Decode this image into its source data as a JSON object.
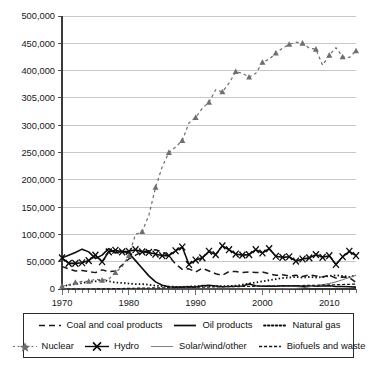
{
  "chart_data": {
    "type": "line",
    "title": "",
    "subtitle": "",
    "xlabel": "",
    "ylabel": "",
    "xlim": [
      1970,
      2014
    ],
    "ylim": [
      0,
      500000
    ],
    "grid": true,
    "legend_position": "bottom",
    "y_ticks": [
      0,
      50000,
      100000,
      150000,
      200000,
      250000,
      300000,
      305000,
      400000,
      450000,
      500000
    ],
    "y_tick_labels": [
      "0",
      "50,000",
      "100,000",
      "150,000",
      "200,000",
      "250,000",
      "300,000",
      "305,000",
      "400,000",
      "450,000",
      "500,000"
    ],
    "x_ticks": [
      1970,
      1980,
      1990,
      2000,
      2010
    ],
    "x_tick_labels": [
      "1970",
      "1980",
      "1990",
      "2000",
      "2010"
    ],
    "x_minor_tick_interval": 1,
    "x": [
      1970,
      1971,
      1972,
      1973,
      1974,
      1975,
      1976,
      1977,
      1978,
      1979,
      1980,
      1981,
      1982,
      1983,
      1984,
      1985,
      1986,
      1987,
      1988,
      1989,
      1990,
      1991,
      1992,
      1993,
      1994,
      1995,
      1996,
      1997,
      1998,
      1999,
      2000,
      2001,
      2002,
      2003,
      2004,
      2005,
      2006,
      2007,
      2008,
      2009,
      2010,
      2011,
      2012,
      2013,
      2014
    ],
    "series": [
      {
        "name": "Coal and coal products",
        "style": "dashed",
        "marker": "none",
        "color": "#1a1a1a",
        "values": [
          41000,
          37000,
          33000,
          34000,
          32000,
          30000,
          35000,
          32000,
          33000,
          44000,
          55000,
          62000,
          68000,
          70000,
          72000,
          68000,
          60000,
          46000,
          36000,
          37000,
          31000,
          38000,
          33000,
          28000,
          25000,
          32000,
          32000,
          30000,
          31000,
          30000,
          31000,
          28000,
          25000,
          26000,
          24000,
          25000,
          23000,
          26000,
          24000,
          22000,
          25000,
          20000,
          22000,
          21000,
          12000
        ]
      },
      {
        "name": "Oil products",
        "style": "solid",
        "marker": "none",
        "color": "#0d0d0d",
        "values": [
          57000,
          62000,
          67000,
          73000,
          68000,
          56000,
          62000,
          74000,
          66000,
          69000,
          66000,
          52000,
          38000,
          24000,
          13000,
          7000,
          4000,
          3500,
          3500,
          4000,
          3500,
          6000,
          7000,
          5500,
          4000,
          4500,
          5000,
          5500,
          9000,
          6000,
          5000,
          5500,
          5000,
          6000,
          5500,
          6000,
          5000,
          5500,
          5000,
          5500,
          6000,
          4500,
          4500,
          4000,
          3500
        ]
      },
      {
        "name": "Natural gas",
        "style": "dotted",
        "marker": "none",
        "color": "#101010",
        "values": [
          5000,
          7000,
          9000,
          11000,
          13000,
          14000,
          17000,
          14000,
          12000,
          11000,
          10000,
          9000,
          9000,
          8000,
          6000,
          5000,
          4500,
          4000,
          4000,
          4500,
          5000,
          6000,
          5500,
          5000,
          5000,
          5500,
          6000,
          8000,
          10000,
          12000,
          14000,
          16000,
          18000,
          20000,
          21000,
          22000,
          21000,
          22000,
          21000,
          22000,
          24000,
          25000,
          24000,
          22000,
          25000
        ]
      },
      {
        "name": "Nuclear",
        "style": "dash-dot",
        "marker": "triangle",
        "color": "#6e6e6e",
        "values": [
          5000,
          8000,
          12000,
          14000,
          14000,
          18000,
          16000,
          18000,
          30000,
          41000,
          61000,
          100000,
          105000,
          135000,
          186000,
          224000,
          250000,
          260000,
          272000,
          304000,
          314000,
          331000,
          342000,
          365000,
          361000,
          377000,
          398000,
          395000,
          388000,
          395000,
          415000,
          421000,
          432000,
          441000,
          448000,
          452000,
          450000,
          441000,
          439000,
          410000,
          428000,
          442000,
          425000,
          424000,
          436000
        ]
      },
      {
        "name": "Hydro",
        "style": "solid",
        "marker": "x",
        "color": "#0d0d0d",
        "values": [
          57000,
          47000,
          47000,
          48000,
          52000,
          62000,
          50000,
          68000,
          71000,
          68000,
          69000,
          72000,
          68000,
          67000,
          64000,
          61000,
          61000,
          70000,
          77000,
          45000,
          53000,
          57000,
          69000,
          63000,
          79000,
          72000,
          64000,
          62000,
          63000,
          72000,
          66000,
          74000,
          60000,
          58000,
          59000,
          51000,
          55000,
          57000,
          63000,
          58000,
          61000,
          45000,
          59000,
          69000,
          61000
        ]
      },
      {
        "name": "Solar/wind/other",
        "style": "solid-thin",
        "marker": "none",
        "color": "#707070",
        "values": [
          0,
          0,
          0,
          0,
          0,
          0,
          0,
          0,
          0,
          0,
          0,
          0,
          0,
          0,
          0,
          0,
          0,
          0,
          0,
          0,
          0,
          0,
          0,
          0,
          0,
          0,
          0,
          0,
          0,
          0,
          100,
          200,
          300,
          400,
          600,
          1000,
          2200,
          4000,
          6000,
          8000,
          10000,
          13000,
          17000,
          21000,
          25000
        ]
      },
      {
        "name": "Biofuels and waste",
        "style": "dash-dot-short",
        "marker": "none",
        "color": "#1a1a1a",
        "values": [
          0,
          0,
          0,
          0,
          0,
          0,
          200,
          400,
          700,
          900,
          1200,
          1400,
          1600,
          1800,
          2000,
          2200,
          2400,
          2600,
          2800,
          3000,
          3200,
          3400,
          3600,
          3800,
          4000,
          4200,
          4400,
          4600,
          4800,
          5000,
          5200,
          5400,
          5600,
          5800,
          6000,
          6200,
          6400,
          6600,
          6800,
          7000,
          7400,
          7800,
          8200,
          8600,
          9000
        ]
      }
    ]
  },
  "legend": {
    "rows": [
      [
        {
          "label": "Coal and coal products",
          "style": "dashed",
          "marker": "none",
          "icon": "dashed-line-icon"
        },
        {
          "label": "Oil products",
          "style": "solid",
          "marker": "none",
          "icon": "solid-line-icon"
        },
        {
          "label": "Natural gas",
          "style": "dotted",
          "marker": "none",
          "icon": "dotted-line-icon"
        }
      ],
      [
        {
          "label": "Nuclear",
          "style": "dash-dot",
          "marker": "star",
          "icon": "star-marker-line-icon"
        },
        {
          "label": "Hydro",
          "style": "solid",
          "marker": "x",
          "icon": "x-marker-line-icon"
        },
        {
          "label": "Solar/wind/other",
          "style": "solid-thin",
          "marker": "none",
          "icon": "thin-line-icon"
        },
        {
          "label": "Biofuels and waste",
          "style": "dash-dot-short",
          "marker": "none",
          "icon": "dash-dot-line-icon"
        }
      ]
    ]
  },
  "colors": {
    "background": "#ffffff",
    "axis": "#3a3a3a",
    "gridline": "#b9b9b9",
    "text": "#161616",
    "nuclear": "#6e6e6e",
    "solar": "#707070",
    "dark_series": "#0d0d0d"
  }
}
